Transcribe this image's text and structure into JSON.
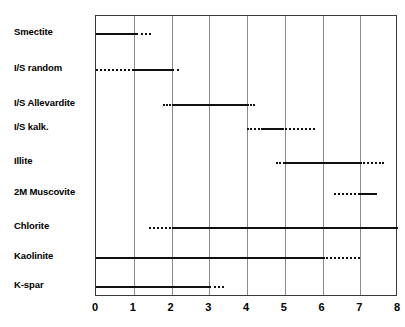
{
  "chart_data": {
    "type": "bar",
    "title": "",
    "subtitle": "",
    "xlabel": "",
    "ylabel": "",
    "orientation": "horizontal",
    "grid": true,
    "legend": null,
    "xlim": [
      0,
      8
    ],
    "xticks": [
      0,
      1,
      2,
      3,
      4,
      5,
      6,
      7,
      8
    ],
    "xticklabels": [
      "0",
      "1",
      "2",
      "3",
      "4",
      "5",
      "6",
      "7",
      "8"
    ],
    "categories": [
      "Smectite",
      "I/S random",
      "I/S Allevardite",
      "I/S kalk.",
      "Illite",
      "2M Muscovite",
      "Chlorite",
      "Kaolinite",
      "K-spar"
    ],
    "series": [
      {
        "name": "Smectite",
        "row": 0,
        "ranges": [
          {
            "style": "solid",
            "start": 0.0,
            "end": 1.05
          },
          {
            "style": "dotted",
            "start": 1.05,
            "end": 1.45
          }
        ]
      },
      {
        "name": "I/S random",
        "row": 1,
        "ranges": [
          {
            "style": "dotted",
            "start": 0.0,
            "end": 1.0
          },
          {
            "style": "solid",
            "start": 1.0,
            "end": 2.0
          },
          {
            "style": "dotted",
            "start": 2.0,
            "end": 2.2
          }
        ]
      },
      {
        "name": "I/S Allevardite",
        "row": 2,
        "ranges": [
          {
            "style": "dotted",
            "start": 1.78,
            "end": 2.0
          },
          {
            "style": "solid",
            "start": 2.0,
            "end": 4.0
          },
          {
            "style": "dotted",
            "start": 4.0,
            "end": 4.22
          }
        ]
      },
      {
        "name": "I/S kalk.",
        "row": 3,
        "ranges": [
          {
            "style": "dotted",
            "start": 4.0,
            "end": 4.42
          },
          {
            "style": "solid",
            "start": 4.42,
            "end": 4.92
          },
          {
            "style": "dotted",
            "start": 4.92,
            "end": 5.8
          }
        ]
      },
      {
        "name": "Illite",
        "row": 4,
        "ranges": [
          {
            "style": "dotted",
            "start": 4.78,
            "end": 5.0
          },
          {
            "style": "solid",
            "start": 5.0,
            "end": 7.0
          },
          {
            "style": "dotted",
            "start": 7.0,
            "end": 7.62
          }
        ]
      },
      {
        "name": "2M Muscovite",
        "row": 5,
        "ranges": [
          {
            "style": "dotted",
            "start": 6.3,
            "end": 7.0
          },
          {
            "style": "solid",
            "start": 7.0,
            "end": 7.45
          }
        ]
      },
      {
        "name": "Chlorite",
        "row": 6,
        "ranges": [
          {
            "style": "dotted",
            "start": 1.4,
            "end": 2.0
          },
          {
            "style": "solid",
            "start": 2.0,
            "end": 8.0
          }
        ]
      },
      {
        "name": "Kaolinite",
        "row": 7,
        "ranges": [
          {
            "style": "solid",
            "start": 0.0,
            "end": 6.0
          },
          {
            "style": "dotted",
            "start": 6.0,
            "end": 7.0
          }
        ]
      },
      {
        "name": "K-spar",
        "row": 8,
        "ranges": [
          {
            "style": "solid",
            "start": 0.0,
            "end": 3.0
          },
          {
            "style": "dotted",
            "start": 3.0,
            "end": 3.4
          }
        ]
      }
    ],
    "colors": {
      "line": "#111111",
      "grid": "#8a8a8a",
      "frame": "#3a3a3a",
      "background": "#ffffff",
      "text": "#000000"
    }
  },
  "layout": {
    "row_y": [
      32,
      68,
      103,
      127,
      161,
      192,
      226,
      256,
      285
    ],
    "plot": {
      "left": 95,
      "top": 15,
      "width": 302,
      "height": 281
    },
    "px_per_unit": 37.75
  },
  "caption": {
    "text": ""
  }
}
